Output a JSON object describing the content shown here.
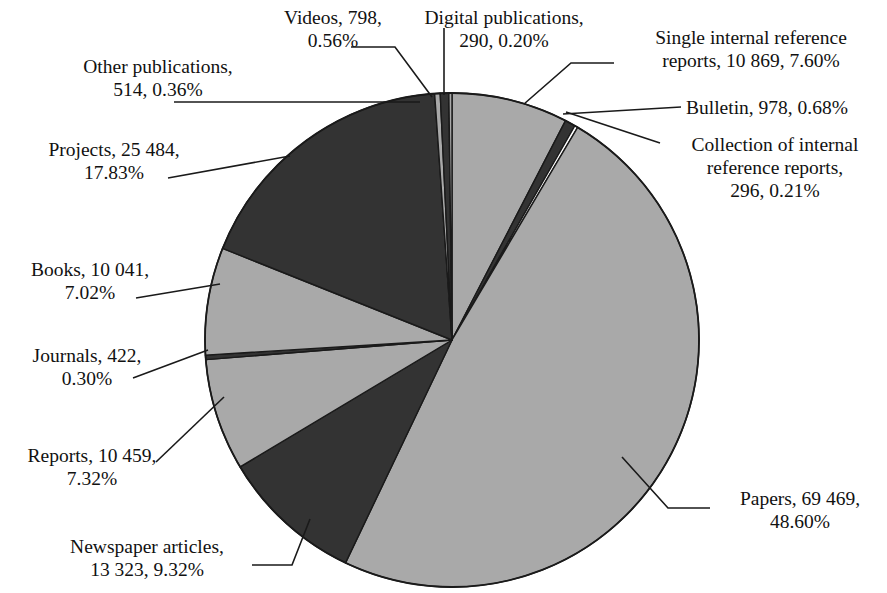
{
  "chart_data": {
    "type": "pie",
    "title": "",
    "total": 142943,
    "start_angle_deg": 0,
    "direction": "clockwise",
    "center": [
      452,
      340
    ],
    "radius": 247,
    "legend": "none",
    "labels_position": "outside-with-leader-lines",
    "categories": [
      "Single internal reference reports",
      "Bulletin",
      "Collection of internal reference reports",
      "Papers",
      "Newspaper articles",
      "Reports",
      "Journals",
      "Books",
      "Projects",
      "Other publications",
      "Videos",
      "Digital publications"
    ],
    "values": [
      10869,
      978,
      296,
      69469,
      13323,
      10459,
      422,
      10041,
      25484,
      514,
      798,
      290
    ],
    "percentages": [
      7.6,
      0.68,
      0.21,
      48.6,
      9.32,
      7.32,
      0.3,
      7.02,
      17.83,
      0.36,
      0.56,
      0.2
    ],
    "colors": [
      "#a9a9a9",
      "#333333",
      "#ffffff",
      "#a9a9a9",
      "#333333",
      "#a9a9a9",
      "#333333",
      "#a9a9a9",
      "#333333",
      "#a9a9a9",
      "#333333",
      "#a9a9a9"
    ],
    "slices": [
      {
        "name": "Single internal reference reports",
        "value": 10869,
        "percent": 7.6,
        "color": "#a9a9a9"
      },
      {
        "name": "Bulletin",
        "value": 978,
        "percent": 0.68,
        "color": "#333333"
      },
      {
        "name": "Collection of internal reference reports",
        "value": 296,
        "percent": 0.21,
        "color": "#ffffff"
      },
      {
        "name": "Papers",
        "value": 69469,
        "percent": 48.6,
        "color": "#a9a9a9"
      },
      {
        "name": "Newspaper articles",
        "value": 13323,
        "percent": 9.32,
        "color": "#333333"
      },
      {
        "name": "Reports",
        "value": 10459,
        "percent": 7.32,
        "color": "#a9a9a9"
      },
      {
        "name": "Journals",
        "value": 422,
        "percent": 0.3,
        "color": "#333333"
      },
      {
        "name": "Books",
        "value": 10041,
        "percent": 7.02,
        "color": "#a9a9a9"
      },
      {
        "name": "Projects",
        "value": 25484,
        "percent": 17.83,
        "color": "#333333"
      },
      {
        "name": "Other publications",
        "value": 514,
        "percent": 0.36,
        "color": "#a9a9a9"
      },
      {
        "name": "Videos",
        "value": 798,
        "percent": 0.56,
        "color": "#333333"
      },
      {
        "name": "Digital publications",
        "value": 290,
        "percent": 0.2,
        "color": "#a9a9a9"
      }
    ]
  },
  "labels": {
    "videos": "Videos, 798,\n0.56%",
    "digital_publications": "Digital publications,\n290, 0.20%",
    "single_internal_reference_reports": "Single internal reference\nreports, 10 869, 7.60%",
    "other_publications": "Other publications,\n514, 0.36%",
    "bulletin": "Bulletin, 978, 0.68%",
    "collection_of_internal_reference_reports": "Collection of internal\nreference reports,\n296, 0.21%",
    "projects": "Projects, 25 484,\n17.83%",
    "books": "Books, 10 041,\n7.02%",
    "journals": "Journals, 422,\n0.30%",
    "reports": "Reports, 10 459,\n7.32%",
    "newspaper_articles": "Newspaper articles,\n13 323, 9.32%",
    "papers": "Papers, 69 469,\n48.60%"
  },
  "style": {
    "light_gray": "#a9a9a9",
    "dark_gray": "#333333",
    "white": "#ffffff",
    "outline": "#1a1a1a",
    "background": "#ffffff",
    "text": "#111111"
  }
}
